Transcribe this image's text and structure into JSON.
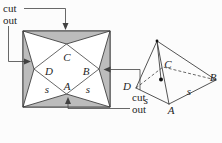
{
  "colors": {
    "cutout_fill": "#bcbcbc",
    "line": "#414141",
    "text": "#1f1f1f",
    "background": "#fcfcfc"
  },
  "net": {
    "face_labels": {
      "top": "C",
      "left": "D",
      "right": "B",
      "bottom": "A"
    },
    "edge_labels": {
      "left": "s",
      "right": "s"
    },
    "annotations": {
      "top_left": {
        "line1": "cut",
        "line2": "out"
      },
      "bottom_right": {
        "line1": "cut",
        "line2": "out"
      }
    }
  },
  "pyramid": {
    "vertex_labels": {
      "left": "D",
      "front": "A",
      "right": "B",
      "back": "C"
    },
    "edge_labels": {
      "left": "s",
      "right": "s"
    }
  }
}
